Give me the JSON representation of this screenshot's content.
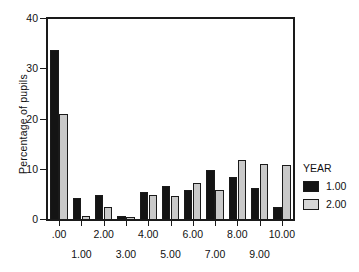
{
  "chart_data": {
    "type": "bar",
    "title": "",
    "xlabel": "",
    "ylabel": "Percentage of pupils",
    "ylim": [
      0,
      40
    ],
    "yticks": [
      0,
      10,
      20,
      30,
      40
    ],
    "ytick_labels": [
      "0",
      "10",
      "20",
      "30",
      "40"
    ],
    "grid": false,
    "legend_position": "right",
    "legend_title": "YEAR",
    "categories": [
      "0",
      "1",
      "2",
      "3",
      "4",
      "5",
      "6",
      "7",
      "8",
      "9",
      "10"
    ],
    "xtick_labels": [
      ".00",
      "1.00",
      "2.00",
      "3.00",
      "4.00",
      "5.00",
      "6.00",
      "7.00",
      "8.00",
      "9.00",
      "10.00"
    ],
    "series": [
      {
        "name": "1.00",
        "color": "#141414",
        "values": [
          33.8,
          4.3,
          5.0,
          0.7,
          5.6,
          6.8,
          5.9,
          9.9,
          8.6,
          6.3,
          2.5
        ]
      },
      {
        "name": "2.00",
        "color": "#c9c9c9",
        "values": [
          21.0,
          0.8,
          2.6,
          0.6,
          5.0,
          4.7,
          7.4,
          5.9,
          12.0,
          11.1,
          10.9
        ]
      }
    ]
  },
  "axes": {
    "y_title": "Percentage of pupils",
    "y_labels": [
      "40",
      "30",
      "20",
      "10",
      "0"
    ],
    "x_labels_top": [
      ".00",
      "2.00",
      "4.00",
      "6.00",
      "8.00",
      "10.00"
    ],
    "x_labels_bottom": [
      "1.00",
      "3.00",
      "5.00",
      "7.00",
      "9.00"
    ]
  },
  "legend": {
    "title": "YEAR",
    "items": [
      {
        "label": "1.00",
        "color": "#141414"
      },
      {
        "label": "2.00",
        "color": "#d6d6d6"
      }
    ]
  }
}
